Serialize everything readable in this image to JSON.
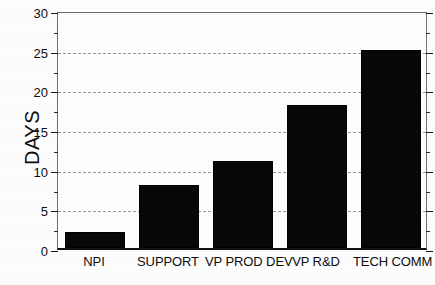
{
  "chart_data": {
    "type": "bar",
    "title": "",
    "subtitle": "",
    "xlabel": "",
    "ylabel": "DAYS",
    "categories": [
      "NPI",
      "SUPPORT",
      "VP PROD DEV",
      "VP R&D",
      "TECH COMM"
    ],
    "values": [
      2,
      8,
      11,
      18,
      25
    ],
    "ylim": [
      0,
      30
    ],
    "ytick_labels": [
      "0",
      "5",
      "10",
      "15",
      "20",
      "25",
      "30"
    ],
    "ytick_values": [
      0,
      5,
      10,
      15,
      20,
      25,
      30
    ],
    "yminor_tick_values": [
      2.5,
      7.5,
      12.5,
      17.5,
      22.5,
      27.5
    ],
    "grid": "horizontal-dashed",
    "legend": "none",
    "annotations": [],
    "colors": {
      "bar_fill": "#080808",
      "gridline": "#9a9a9a",
      "axis": "#111111",
      "text": "#0e0e0e",
      "background": "#ffffff"
    }
  }
}
